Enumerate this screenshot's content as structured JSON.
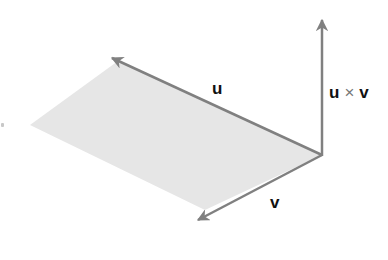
{
  "diagram": {
    "colors": {
      "background": "#ffffff",
      "parallelogram_fill": "#e6e6e6",
      "arrow": "#808080",
      "label": "#111111"
    },
    "origin": [
      322,
      155
    ],
    "vectors": {
      "u": {
        "label": "u",
        "tip": [
          112,
          58
        ]
      },
      "v": {
        "label": "v",
        "tip": [
          198,
          220
        ]
      },
      "u_cross_v": {
        "label_left": "u",
        "operator": "×",
        "label_right": "v",
        "tip": [
          322,
          20
        ]
      }
    },
    "parallelogram": [
      [
        322,
        155
      ],
      [
        112,
        60
      ],
      [
        30,
        125
      ],
      [
        205,
        210
      ]
    ]
  }
}
